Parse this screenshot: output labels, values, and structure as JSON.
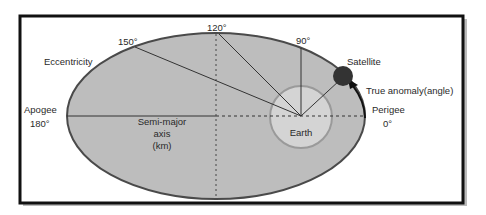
{
  "figure": {
    "colors": {
      "frame": "#111111",
      "orbit_fill": "#bdbdbd",
      "orbit_stroke": "#4a4a4a",
      "earth_fill": "#d4d4d4",
      "earth_stroke": "#9a9a9a",
      "satellite": "#333333",
      "line": "#333333"
    }
  },
  "labels": {
    "eccentricity": "Eccentricity",
    "angle_150": "150°",
    "angle_120": "120°",
    "angle_90": "90°",
    "satellite": "Satellite",
    "true_anomaly": "True anomaly(angle)",
    "apogee": "Apogee",
    "apogee_angle": "180°",
    "perigee": "Perigee",
    "perigee_angle": "0°",
    "semi_major_line1": "Semi-major",
    "semi_major_line2": "axis",
    "semi_major_line3": "(km)",
    "earth": "Earth"
  }
}
